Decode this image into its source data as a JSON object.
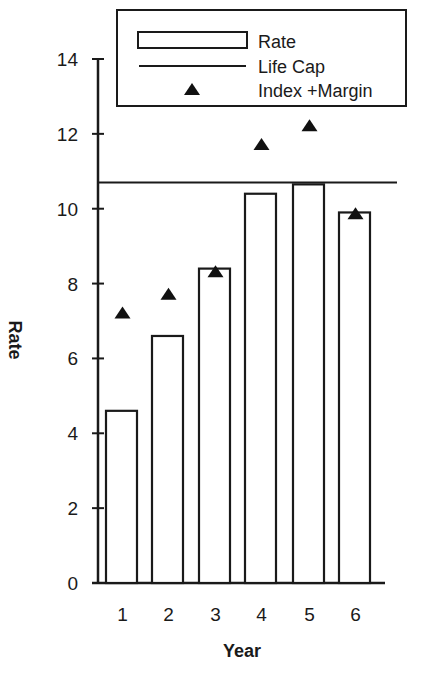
{
  "chart_data": {
    "type": "bar",
    "title": "",
    "xlabel": "Year",
    "ylabel": "Rate",
    "categories": [
      "1",
      "2",
      "3",
      "4",
      "5",
      "6"
    ],
    "series": [
      {
        "name": "Rate",
        "kind": "bar",
        "values": [
          4.6,
          6.6,
          8.4,
          10.4,
          10.65,
          9.9
        ]
      },
      {
        "name": "Index +Margin",
        "kind": "marker-triangle",
        "values": [
          7.2,
          7.7,
          8.3,
          11.7,
          12.2,
          9.85
        ]
      },
      {
        "name": "Life Cap",
        "kind": "hline",
        "value": 10.7
      }
    ],
    "ylim": [
      0,
      14
    ],
    "yticks": [
      0,
      2,
      4,
      6,
      8,
      10,
      12,
      14
    ],
    "grid": false,
    "legend_position": "top"
  },
  "axis": {
    "ytick_labels": [
      "0",
      "2",
      "4",
      "6",
      "8",
      "10",
      "12",
      "14"
    ],
    "xtick_labels": [
      "1",
      "2",
      "3",
      "4",
      "5",
      "6"
    ],
    "xlabel": "Year",
    "ylabel": "Rate"
  },
  "legend": {
    "items": [
      {
        "label": "Rate",
        "symbol": "bar"
      },
      {
        "label": "Life Cap",
        "symbol": "line"
      },
      {
        "label": "Index +Margin",
        "symbol": "triangle"
      }
    ]
  },
  "colors": {
    "ink": "#1a1a1a",
    "background": "#ffffff"
  }
}
